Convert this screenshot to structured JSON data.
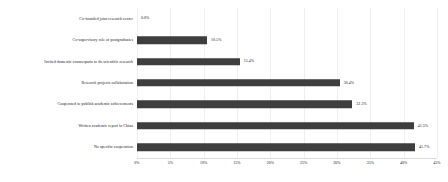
{
  "chart_data": {
    "type": "bar",
    "orientation": "horizontal",
    "title": "",
    "subtitle": "",
    "xlabel": "",
    "ylabel": "",
    "xlim": [
      0,
      45
    ],
    "grid": true,
    "legend": null,
    "bar_color": "#3e3e3e",
    "categories": [
      "Co-founded joint research center",
      "Co-supervisory role of postgraduates",
      "Invited domestic counterparts to do scientific research",
      "Research projects collaboration",
      "Cooperated to publish academic achievements",
      "Written academic report in China",
      "No specific cooperation"
    ],
    "values": [
      0.0,
      10.5,
      15.4,
      30.4,
      32.3,
      41.5,
      41.7
    ],
    "value_labels": [
      "0.0%",
      "10.5%",
      "15.4%",
      "30.4%",
      "32.3%",
      "41.5%",
      "41.7%"
    ],
    "xticks": [
      0,
      5,
      10,
      15,
      20,
      25,
      30,
      35,
      40,
      45
    ],
    "xtick_labels": [
      "0%",
      "5%",
      "10%",
      "15%",
      "20%",
      "25%",
      "30%",
      "35%",
      "40%",
      "45%"
    ]
  }
}
